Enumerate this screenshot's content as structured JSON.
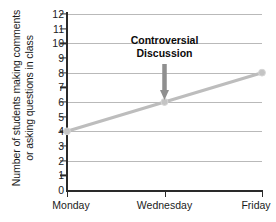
{
  "chart_data": {
    "type": "line",
    "title": "",
    "xlabel": "",
    "ylabel_line1": "Number of students making comments",
    "ylabel_line2": "or asking questions in class",
    "categories": [
      "Monday",
      "Wednesday",
      "Friday"
    ],
    "values": [
      4,
      6,
      8
    ],
    "series": [
      {
        "name": "Students participating",
        "values": [
          4,
          6,
          8
        ]
      }
    ],
    "ylim": [
      0,
      12
    ],
    "yticks": [
      0,
      1,
      2,
      3,
      4,
      5,
      6,
      7,
      8,
      9,
      10,
      11,
      12
    ],
    "ytick_labels": [
      "0",
      "1",
      "2",
      "3",
      "4",
      "5",
      "6",
      "7",
      "8",
      "9",
      "10",
      "11",
      "12"
    ],
    "gridlines": [
      2,
      4,
      6,
      8,
      10,
      12
    ],
    "grid": true,
    "legend": "none",
    "annotations": [
      {
        "text_line1": "Controversial",
        "text_line2": "Discussion",
        "points_to_category": "Wednesday",
        "points_to_value": 6,
        "arrow": "down"
      }
    ],
    "colors": {
      "line": "#bdbdbd",
      "marker": "#c4c4c4",
      "grid": "#b9b9b9",
      "axis": "#2a2a2a",
      "text": "#1b1b1b",
      "annotation_text": "#0a0a0a",
      "arrow": "#8f8f8f",
      "background": "#ffffff"
    }
  }
}
